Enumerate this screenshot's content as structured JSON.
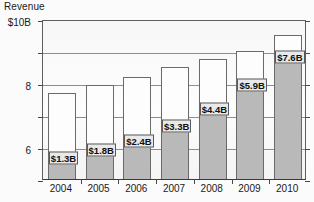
{
  "chart_data": {
    "type": "bar",
    "subtype": "stacked-bar",
    "title": "",
    "ylabel": "Revenue",
    "y_unit_label": "$10B",
    "xlabel": "",
    "categories": [
      "2004",
      "2005",
      "2006",
      "2007",
      "2008",
      "2009",
      "2010"
    ],
    "ylim": [
      0,
      10
    ],
    "yticks": [
      0,
      2,
      4,
      6,
      8,
      10
    ],
    "ytick_labels": [
      "0",
      "2",
      "4",
      "6",
      "8",
      "$10B"
    ],
    "grid": true,
    "gridlines_at": [
      2,
      4,
      6,
      8,
      10
    ],
    "legend": null,
    "series": [
      {
        "name": "Shaded segment",
        "color": "#b9b9b9",
        "values": [
          1.3,
          1.8,
          2.4,
          3.3,
          4.4,
          5.9,
          7.6
        ],
        "data_labels": [
          "$1.3B",
          "$1.8B",
          "$2.4B",
          "$3.3B",
          "$4.4B",
          "$5.9B",
          "$7.6B"
        ]
      },
      {
        "name": "Upper segment",
        "color": "#fdfdfd",
        "values": [
          4.1,
          4.1,
          4.0,
          3.7,
          3.1,
          2.1,
          1.4
        ]
      }
    ],
    "totals": [
      5.4,
      5.9,
      6.4,
      7.0,
      7.5,
      8.0,
      9.0
    ]
  },
  "axis": {
    "title": "Revenue"
  }
}
